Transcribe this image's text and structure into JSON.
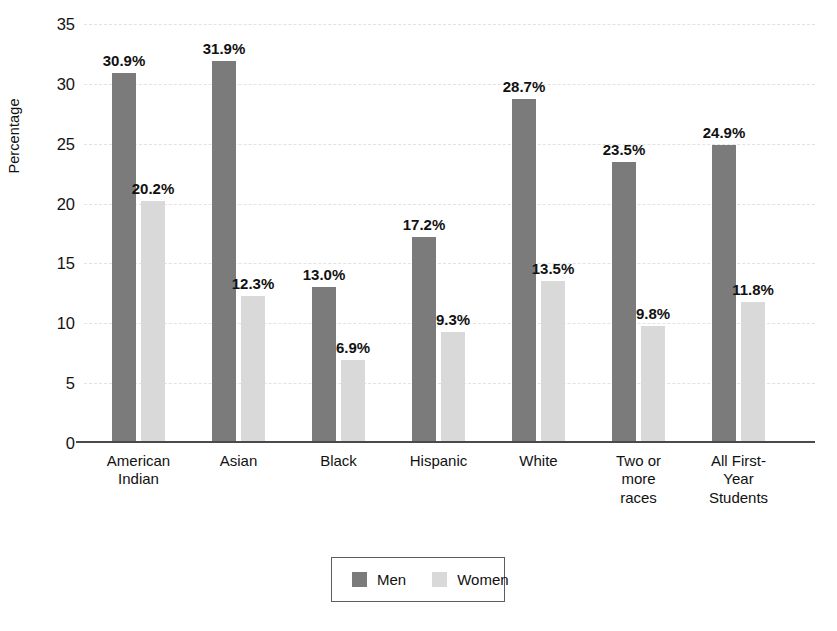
{
  "chart_data": {
    "type": "bar",
    "title": "",
    "xlabel": "",
    "ylabel": "Percentage",
    "ylim": [
      0,
      35
    ],
    "ytick_step": 5,
    "yticks": [
      "35",
      "30",
      "25",
      "20",
      "15",
      "10",
      "5",
      "0"
    ],
    "grid": true,
    "legend_position": "bottom-center",
    "value_suffix": "%",
    "categories": [
      "American\nIndian",
      "Asian",
      "Black",
      "Hispanic",
      "White",
      "Two or\nmore\nraces",
      "All First-\nYear\nStudents"
    ],
    "series": [
      {
        "name": "Men",
        "color": "#7b7b7b",
        "values": [
          30.9,
          31.9,
          13.0,
          17.2,
          28.7,
          23.5,
          24.9
        ],
        "labels": [
          "30.9%",
          "31.9%",
          "13.0%",
          "17.2%",
          "28.7%",
          "23.5%",
          "24.9%"
        ]
      },
      {
        "name": "Women",
        "color": "#d9d9d9",
        "values": [
          20.2,
          12.3,
          6.9,
          9.3,
          13.5,
          9.8,
          11.8
        ],
        "labels": [
          "20.2%",
          "12.3%",
          "6.9%",
          "9.3%",
          "13.5%",
          "9.8%",
          "11.8%"
        ]
      }
    ]
  },
  "legend": {
    "items": [
      {
        "label": "Men",
        "color": "#7b7b7b"
      },
      {
        "label": "Women",
        "color": "#d9d9d9"
      }
    ]
  },
  "axis": {
    "y_title": "Percentage"
  }
}
